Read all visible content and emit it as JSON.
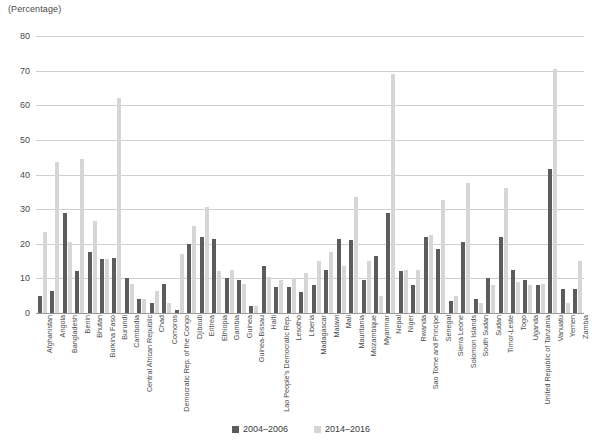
{
  "axis_unit_label": "(Percentage)",
  "legend": [
    {
      "label": "2004–2006",
      "color": "#5c5c5c"
    },
    {
      "label": "2014–2016",
      "color": "#d6d6d6"
    }
  ],
  "colors": {
    "series_2004_2006": "#5c5c5c",
    "series_2014_2016": "#d6d6d6",
    "gridline": "#cfcfcf",
    "axis": "#9a9a9a",
    "text": "#4a4a4a",
    "background": "#ffffff"
  },
  "chart_data": {
    "type": "bar",
    "title": "",
    "subtitle": "",
    "xlabel": "",
    "ylabel": "(Percentage)",
    "ylim": [
      0,
      80
    ],
    "yticks": [
      0,
      10,
      20,
      30,
      40,
      50,
      60,
      70,
      80
    ],
    "grid": true,
    "legend_position": "bottom",
    "categories": [
      "Afghanistan",
      "Angola",
      "Bangladesh",
      "Benin",
      "Bhutan",
      "Burkina Faso",
      "Burundi",
      "Cambodia",
      "Central African Republic",
      "Chad",
      "Comoros",
      "Democratic Rep. of the Congo",
      "Djibouti",
      "Eritrea",
      "Ethiopia",
      "Gambia",
      "Guinea",
      "Guinea-Bissau",
      "Haiti",
      "Lao People's Democratic Rep.",
      "Lesotho",
      "Liberia",
      "Madagascar",
      "Malawi",
      "Mali",
      "Mauritania",
      "Mozambique",
      "Myanmar",
      "Nepal",
      "Niger",
      "Rwanda",
      "Sao Tome and Principe",
      "Senegal",
      "Sierra Leone",
      "Solomon Islands",
      "South Sudan",
      "Sudan",
      "Timor-Leste",
      "Togo",
      "Uganda",
      "United Republic of Tanzania",
      "Vanuatu",
      "Yemen",
      "Zambia"
    ],
    "series": [
      {
        "name": "2004–2006",
        "color": "#5c5c5c",
        "values": [
          5,
          6.5,
          29,
          12,
          17.5,
          15.5,
          16,
          10,
          4,
          3,
          8.5,
          1,
          20,
          22,
          21.5,
          10,
          9.5,
          2,
          13.5,
          7.5,
          7.5,
          6,
          8,
          12.5,
          21.5,
          21,
          9.5,
          16.5,
          29,
          12,
          8,
          22,
          18.5,
          3.5,
          20.5,
          4,
          10,
          22,
          12.5,
          9.5,
          8,
          41.5,
          7,
          7
        ]
      },
      {
        "name": "2014–2016",
        "color": "#d6d6d6",
        "values": [
          23.5,
          43.5,
          20.5,
          44.5,
          26.5,
          15.5,
          62,
          8.5,
          4,
          6.5,
          3,
          17,
          25,
          30.5,
          12,
          12.5,
          8.5,
          2,
          10.5,
          9.5,
          10,
          11.5,
          15,
          17.5,
          13.5,
          33.5,
          15,
          5,
          69,
          12.5,
          12.5,
          22.5,
          32.5,
          5,
          37.5,
          3,
          8,
          36,
          9,
          8,
          8.5,
          70.5,
          3,
          15
        ]
      }
    ]
  }
}
